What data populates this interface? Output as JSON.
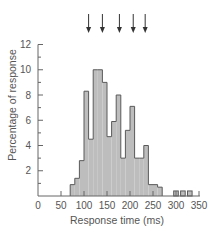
{
  "chart_data": {
    "type": "bar",
    "title": "",
    "xlabel": "Response time (ms)",
    "ylabel": "Percentage of response",
    "xlim": [
      0,
      350
    ],
    "ylim": [
      0,
      12
    ],
    "x_ticks": [
      0,
      50,
      100,
      150,
      200,
      250,
      300,
      350
    ],
    "x_tick_labels": [
      "0",
      "50",
      "100",
      "150",
      "200",
      "250",
      "300",
      "350"
    ],
    "y_ticks": [
      2,
      4,
      6,
      8,
      10,
      12
    ],
    "y_tick_labels": [
      "2",
      "4",
      "6",
      "8",
      "10",
      "12"
    ],
    "y_minor_ticks": [
      1,
      3,
      5,
      7,
      9,
      11
    ],
    "grid": false,
    "legend": null,
    "bin_width_ms": 10,
    "bins": [
      {
        "start": 70,
        "end": 80,
        "value": 0.9
      },
      {
        "start": 80,
        "end": 90,
        "value": 1.4
      },
      {
        "start": 90,
        "end": 100,
        "value": 2.8
      },
      {
        "start": 100,
        "end": 110,
        "value": 8.3
      },
      {
        "start": 110,
        "end": 120,
        "value": 4.5
      },
      {
        "start": 120,
        "end": 130,
        "value": 10.0
      },
      {
        "start": 130,
        "end": 140,
        "value": 10.0
      },
      {
        "start": 140,
        "end": 150,
        "value": 9.0
      },
      {
        "start": 150,
        "end": 160,
        "value": 4.7
      },
      {
        "start": 160,
        "end": 170,
        "value": 5.9
      },
      {
        "start": 170,
        "end": 180,
        "value": 8.0
      },
      {
        "start": 180,
        "end": 190,
        "value": 3.0
      },
      {
        "start": 190,
        "end": 200,
        "value": 5.2
      },
      {
        "start": 200,
        "end": 210,
        "value": 7.1
      },
      {
        "start": 210,
        "end": 220,
        "value": 3.0
      },
      {
        "start": 220,
        "end": 230,
        "value": 3.0
      },
      {
        "start": 230,
        "end": 240,
        "value": 4.0
      },
      {
        "start": 240,
        "end": 250,
        "value": 0.9
      },
      {
        "start": 250,
        "end": 260,
        "value": 0.9
      },
      {
        "start": 260,
        "end": 270,
        "value": 0.7
      },
      {
        "start": 295,
        "end": 305,
        "value": 0.4
      },
      {
        "start": 310,
        "end": 320,
        "value": 0.4
      },
      {
        "start": 325,
        "end": 335,
        "value": 0.4
      }
    ],
    "annotations": {
      "arrows_ms": [
        110,
        140,
        177,
        207,
        233
      ],
      "description": "Downward arrows above the histogram marking periodic peaks"
    },
    "colors": {
      "bar_fill": "#bdbdbd",
      "bar_stroke": "#5a5a5a",
      "axis": "#666666",
      "text": "#555555",
      "arrow": "#333333"
    }
  }
}
